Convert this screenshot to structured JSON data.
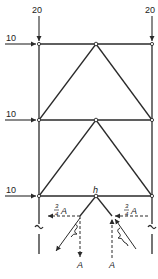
{
  "diagram": {
    "type": "portal frame with K-bracing (structural load diagram)",
    "colors": {
      "line": "#2a2a2a",
      "background": "#ffffff"
    },
    "loads": {
      "vertical_left": "20",
      "vertical_right": "20",
      "horizontal_top": "10",
      "horizontal_middle": "10",
      "horizontal_bottom": "10"
    },
    "node_label": "h",
    "force_labels": {
      "left_horizontal_num": "3",
      "left_horizontal_den": "4",
      "left_horizontal_var": "A",
      "right_horizontal_num": "3",
      "right_horizontal_den": "4",
      "right_horizontal_var": "A",
      "left_vertical": "A",
      "right_vertical": "A"
    }
  }
}
